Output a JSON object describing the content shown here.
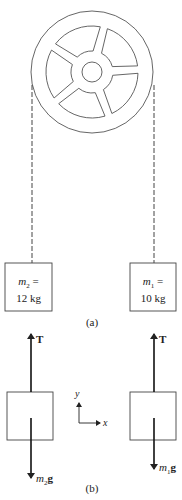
{
  "figure_a": {
    "caption": "(a)",
    "mass2": {
      "symbol": "m",
      "subscript": "2",
      "eq": " =",
      "value": "12 kg"
    },
    "mass1": {
      "symbol": "m",
      "subscript": "1",
      "eq": " =",
      "value": "10 kg"
    },
    "pulley": {
      "spokes": 5
    }
  },
  "figure_b": {
    "caption": "(b)",
    "tension_label": "T",
    "weight2": {
      "symbol": "m",
      "subscript": "2",
      "suffix": "g"
    },
    "weight1": {
      "symbol": "m",
      "subscript": "1",
      "suffix": "g"
    },
    "axes": {
      "x": "x",
      "y": "y"
    }
  },
  "colors": {
    "line": "#333333",
    "rope": "#444444"
  }
}
